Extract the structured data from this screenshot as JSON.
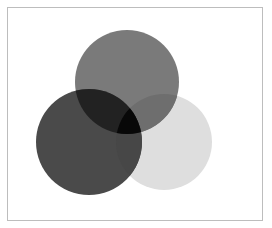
{
  "diagram": {
    "type": "venn",
    "circles": [
      {
        "name": "top",
        "cx": 127,
        "cy": 82,
        "r": 52,
        "color": "#7a7a7a"
      },
      {
        "name": "bottom-left",
        "cx": 89,
        "cy": 142,
        "r": 53,
        "color": "#4a4a4a"
      },
      {
        "name": "bottom-right",
        "cx": 164,
        "cy": 142,
        "r": 48,
        "color": "#dedede"
      }
    ],
    "colors": {
      "top_left_overlap": "#222222",
      "top_right_overlap": "#6e6e6e",
      "left_right_overlap": "#474747",
      "center": "#080808"
    }
  }
}
